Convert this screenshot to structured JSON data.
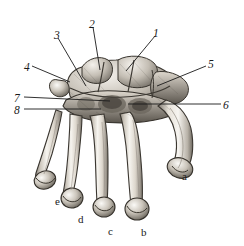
{
  "figure": {
    "kind": "anatomical-illustration",
    "background_color": "#ffffff",
    "ink_color": "#1a1a1a",
    "bone_fill_light": "#f2efe9",
    "bone_fill_mid": "#cfc9bf",
    "bone_shadow": "#6f6a62",
    "width": 244,
    "height": 246
  },
  "numeric_labels": [
    {
      "id": "label-1",
      "text": "1",
      "x": 153,
      "y": 28
    },
    {
      "id": "label-2",
      "text": "2",
      "x": 89,
      "y": 19
    },
    {
      "id": "label-3",
      "text": "3",
      "x": 54,
      "y": 30
    },
    {
      "id": "label-4",
      "text": "4",
      "x": 24,
      "y": 62
    },
    {
      "id": "label-5",
      "text": "5",
      "x": 208,
      "y": 59
    },
    {
      "id": "label-6",
      "text": "6",
      "x": 223,
      "y": 100
    },
    {
      "id": "label-7",
      "text": "7",
      "x": 14,
      "y": 93
    },
    {
      "id": "label-8",
      "text": "8",
      "x": 14,
      "y": 105
    }
  ],
  "letter_labels": [
    {
      "id": "label-a",
      "text": "a",
      "x": 182,
      "y": 171
    },
    {
      "id": "label-b",
      "text": "b",
      "x": 141,
      "y": 227
    },
    {
      "id": "label-c",
      "text": "c",
      "x": 108,
      "y": 226
    },
    {
      "id": "label-d",
      "text": "d",
      "x": 78,
      "y": 214
    },
    {
      "id": "label-e",
      "text": "e",
      "x": 55,
      "y": 196
    }
  ],
  "leader_lines": [
    {
      "id": "leader-1",
      "from_label": "1",
      "x1": 155,
      "y1": 36,
      "x2": 126,
      "y2": 71
    },
    {
      "id": "leader-2",
      "from_label": "2",
      "x1": 93,
      "y1": 27,
      "x2": 100,
      "y2": 70
    },
    {
      "id": "leader-3",
      "from_label": "3",
      "x1": 58,
      "y1": 38,
      "x2": 86,
      "y2": 86
    },
    {
      "id": "leader-4",
      "from_label": "4",
      "x1": 32,
      "y1": 66,
      "x2": 70,
      "y2": 82
    },
    {
      "id": "leader-5",
      "from_label": "5",
      "x1": 206,
      "y1": 66,
      "x2": 157,
      "y2": 86
    },
    {
      "id": "leader-6",
      "from_label": "6",
      "x1": 221,
      "y1": 104,
      "x2": 128,
      "y2": 104
    },
    {
      "id": "leader-7",
      "from_label": "7",
      "x1": 24,
      "y1": 97,
      "x2": 110,
      "y2": 101
    },
    {
      "id": "leader-8",
      "from_label": "8",
      "x1": 24,
      "y1": 109,
      "x2": 101,
      "y2": 109
    }
  ]
}
